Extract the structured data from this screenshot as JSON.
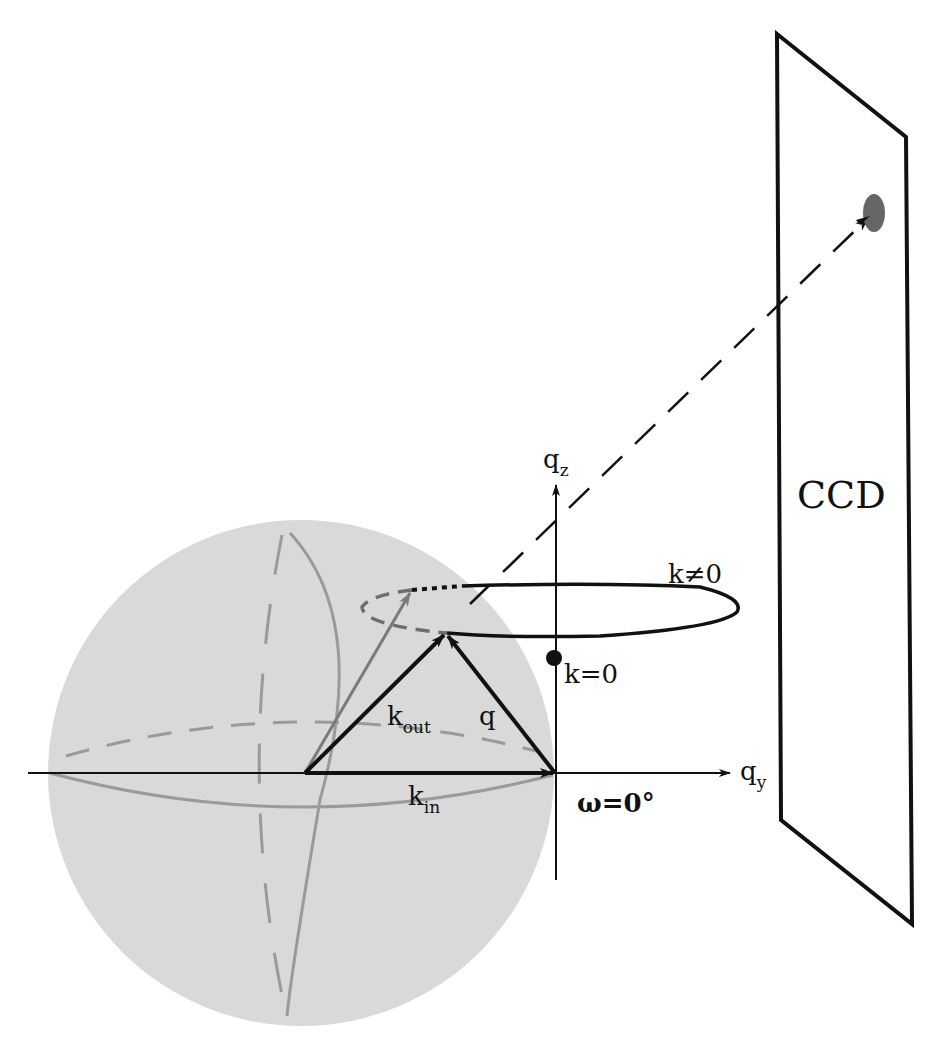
{
  "figure": {
    "type": "scattering-geometry-diagram",
    "colors": {
      "background": "#ffffff",
      "sphere_fill": "#d9d9d9",
      "sphere_lines": "#9a9a9a",
      "dashed_ring": "#6e6e6e",
      "ink": "#111111",
      "spot": "#666666",
      "gray_arrow": "#7a7a7a"
    }
  },
  "labels": {
    "axis_qz_main": "q",
    "axis_qz_sub": "z",
    "axis_qy_main": "q",
    "axis_qy_sub": "y",
    "k_out_main": "k",
    "k_out_sub": "out",
    "k_in_main": "k",
    "k_in_sub": "in",
    "q": "q",
    "k_zero": "k=0",
    "k_nonzero": "k≠0",
    "omega": "ω=0°",
    "detector": "CCD"
  },
  "elements": {
    "ewald_sphere": "Ewald sphere (shaded)",
    "ring": "k≠0 ring (solid front, dashed/dotted back)",
    "scattered_beam": "dashed ray to CCD spot",
    "detector_plane": "CCD parallelogram",
    "spot": "diffraction spot on CCD"
  }
}
